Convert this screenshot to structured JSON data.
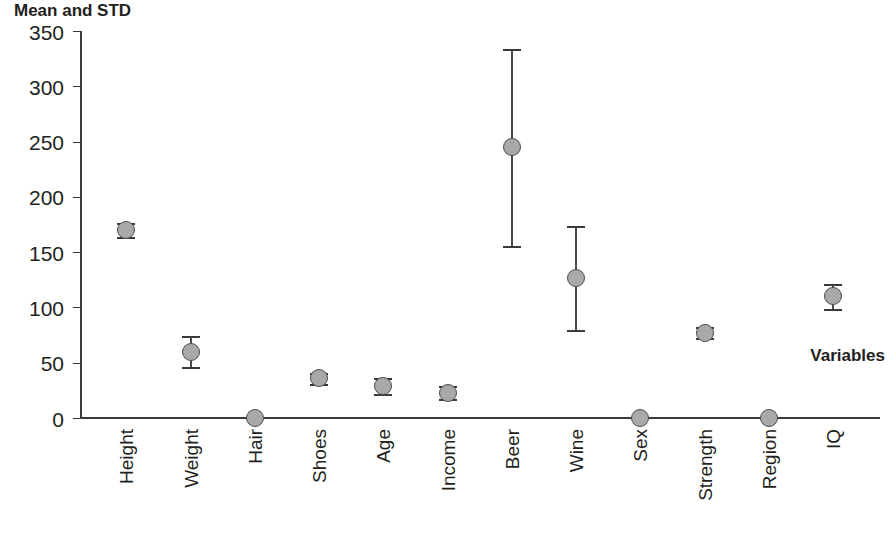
{
  "chart_data": {
    "type": "scatter",
    "title": "Mean and STD",
    "xlabel": "Variables",
    "ylabel": "",
    "ylim": [
      0,
      350
    ],
    "yticks": [
      0,
      50,
      100,
      150,
      200,
      250,
      300,
      350
    ],
    "grid": false,
    "legend": null,
    "error_bars": "std",
    "categories": [
      "Height",
      "Weight",
      "Hair",
      "Shoes",
      "Age",
      "Income",
      "Beer",
      "Wine",
      "Sex",
      "Strength",
      "Region",
      "IQ"
    ],
    "values": [
      170,
      60,
      0,
      36,
      29,
      23,
      245,
      127,
      0,
      77,
      0,
      110
    ],
    "std": [
      6,
      14,
      0,
      5,
      7,
      6,
      89,
      47,
      0,
      5,
      0,
      11
    ],
    "points": [
      {
        "label": "Height",
        "mean": 170,
        "std": 6,
        "low": 164,
        "high": 176
      },
      {
        "label": "Weight",
        "mean": 60,
        "std": 14,
        "low": 46,
        "high": 74
      },
      {
        "label": "Hair",
        "mean": 0,
        "std": 0,
        "low": 0,
        "high": 0
      },
      {
        "label": "Shoes",
        "mean": 36,
        "std": 5,
        "low": 31,
        "high": 41
      },
      {
        "label": "Age",
        "mean": 29,
        "std": 7,
        "low": 22,
        "high": 36
      },
      {
        "label": "Income",
        "mean": 23,
        "std": 6,
        "low": 17,
        "high": 29
      },
      {
        "label": "Beer",
        "mean": 245,
        "std": 89,
        "low": 156,
        "high": 334
      },
      {
        "label": "Wine",
        "mean": 127,
        "std": 47,
        "low": 80,
        "high": 174
      },
      {
        "label": "Sex",
        "mean": 0,
        "std": 0,
        "low": 0,
        "high": 0
      },
      {
        "label": "Strength",
        "mean": 77,
        "std": 5,
        "low": 72,
        "high": 82
      },
      {
        "label": "Region",
        "mean": 0,
        "std": 0,
        "low": 0,
        "high": 0
      },
      {
        "label": "IQ",
        "mean": 110,
        "std": 11,
        "low": 99,
        "high": 121
      }
    ]
  },
  "style": {
    "marker_fill": "#a9a9a9",
    "marker_stroke": "#4d4d4d",
    "axis_color": "#3a3a3a",
    "text_color": "#231f20",
    "background": "#ffffff"
  }
}
